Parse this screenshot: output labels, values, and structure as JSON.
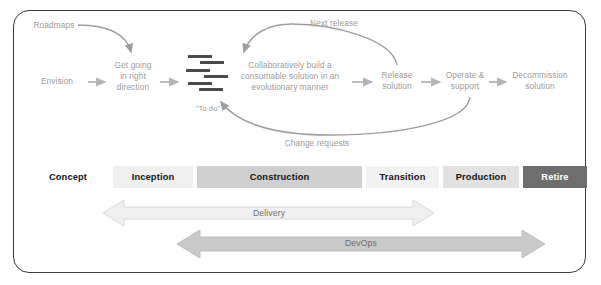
{
  "diagram": {
    "title_present": false,
    "colors": {
      "frame_border": "#3a3a3a",
      "flow_text": "#9b9b9b",
      "flow_arrow": "#b5b5b5",
      "curve": "#9e9e9e",
      "backlog_line": "#4a4a4a",
      "phase_text": "#111111",
      "retire_bg": "#6e6e6e",
      "retire_text": "#ffffff",
      "delivery_fill": "#f0f0f0",
      "devops_fill": "#c9c9c9"
    }
  },
  "flow": {
    "nodes": [
      {
        "id": "envision",
        "label": "Envision"
      },
      {
        "id": "get-going",
        "label": "Get going\nin right\ndirection"
      },
      {
        "id": "backlog",
        "label": "\"To do\""
      },
      {
        "id": "build",
        "label": "Collaboratively build a\nconsumable solution in an\nevolutionary manner"
      },
      {
        "id": "release",
        "label": "Release\nsolution"
      },
      {
        "id": "operate",
        "label": "Operate &\nsupport"
      },
      {
        "id": "decommission",
        "label": "Decommission\nsolution"
      }
    ],
    "annotations": [
      {
        "id": "roadmaps",
        "label": "Roadmaps"
      },
      {
        "id": "next-release",
        "label": "Next release"
      },
      {
        "id": "change-requests",
        "label": "Change requests"
      }
    ]
  },
  "phases": [
    {
      "label": "Concept",
      "bg": "#ffffff",
      "fg": "#111111"
    },
    {
      "label": "Inception",
      "bg": "#efefef",
      "fg": "#111111"
    },
    {
      "label": "Construction",
      "bg": "#cfcfcf",
      "fg": "#111111"
    },
    {
      "label": "Transition",
      "bg": "#f2f2f2",
      "fg": "#111111"
    },
    {
      "label": "Production",
      "bg": "#e2e2e2",
      "fg": "#111111"
    },
    {
      "label": "Retire",
      "bg": "#6e6e6e",
      "fg": "#ffffff"
    }
  ],
  "spans": [
    {
      "id": "delivery",
      "label": "Delivery"
    },
    {
      "id": "devops",
      "label": "DevOps"
    }
  ]
}
